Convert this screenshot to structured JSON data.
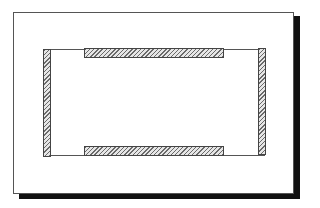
{
  "diagram": {
    "title": "",
    "frame": {
      "x": 13,
      "y": 12,
      "width": 279,
      "height": 180,
      "drop_shadow": true,
      "shadow_color": "#111111"
    },
    "inner_rect": {
      "x": 43,
      "y": 49,
      "width": 222,
      "height": 107
    },
    "bars": [
      {
        "id": "top",
        "orientation": "horizontal",
        "x": 84,
        "y": 48,
        "width": 140,
        "height": 10,
        "fill": "hatched"
      },
      {
        "id": "bottom",
        "orientation": "horizontal",
        "x": 84,
        "y": 146,
        "width": 140,
        "height": 10,
        "fill": "hatched"
      },
      {
        "id": "left",
        "orientation": "vertical",
        "x": 43,
        "y": 49,
        "width": 8,
        "height": 108,
        "fill": "hatched"
      },
      {
        "id": "right",
        "orientation": "vertical",
        "x": 258,
        "y": 48,
        "width": 8,
        "height": 107,
        "fill": "hatched"
      }
    ],
    "colors": {
      "background": "#ffffff",
      "outline": "#555555",
      "hatch": "#6a6a6a"
    }
  }
}
